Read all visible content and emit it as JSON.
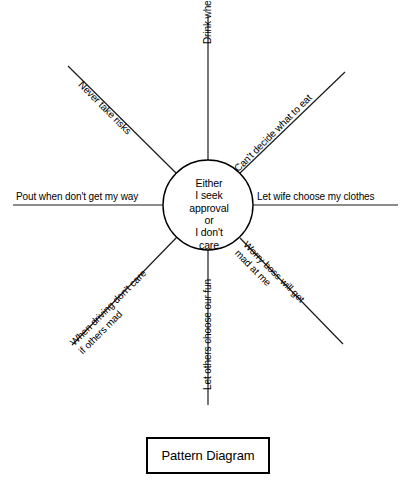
{
  "diagram": {
    "type": "radial-spoke",
    "hub": {
      "name": "center-circle",
      "lines": [
        "Either",
        "I seek",
        "approval",
        "or",
        "I don't",
        "care"
      ],
      "cx": 208,
      "cy": 205,
      "r": 45,
      "stroke": "#000000",
      "fill": "#ffffff"
    },
    "spokes": [
      {
        "id": "left",
        "direction": "west",
        "label": "Pout when don't get my way",
        "lines": [
          "Pout when don't get my way"
        ],
        "angle_deg": 180,
        "x1": 13,
        "y1": 205,
        "x2": 163,
        "y2": 205
      },
      {
        "id": "right",
        "direction": "east",
        "label": "Let wife choose my clothes",
        "lines": [
          "Let wife choose my clothes"
        ],
        "angle_deg": 0,
        "x1": 253,
        "y1": 205,
        "x2": 398,
        "y2": 205
      },
      {
        "id": "top",
        "direction": "north",
        "label": "Drink when feel criticized",
        "lines": [
          "Drink when feel criticized"
        ],
        "angle_deg": -90,
        "x1": 208,
        "y1": 16,
        "x2": 208,
        "y2": 160
      },
      {
        "id": "bottom",
        "direction": "south",
        "label": "Let others choose our fun",
        "lines": [
          "Let others choose our fun"
        ],
        "angle_deg": -90,
        "x1": 208,
        "y1": 250,
        "x2": 208,
        "y2": 405
      },
      {
        "id": "upper-left",
        "direction": "northwest",
        "label": "Never take risks",
        "lines": [
          "Never take risks"
        ],
        "angle_deg": 45,
        "x1": 68,
        "y1": 66,
        "x2": 176,
        "y2": 173
      },
      {
        "id": "upper-right",
        "direction": "northeast",
        "label": "Can't decide what to eat",
        "lines": [
          "Can't decide what to eat"
        ],
        "angle_deg": -45,
        "x1": 240,
        "y1": 173,
        "x2": 345,
        "y2": 72
      },
      {
        "id": "lower-left",
        "direction": "southwest",
        "label": "When driving don't care if others mad",
        "lines": [
          "When driving don't care",
          "if others mad"
        ],
        "angle_deg": -45,
        "x1": 72,
        "y1": 345,
        "x2": 176,
        "y2": 238
      },
      {
        "id": "lower-right",
        "direction": "southeast",
        "label": "Worry boss will get mad at me",
        "lines": [
          "Worry boss will get",
          "mad at me"
        ],
        "angle_deg": 45,
        "x1": 240,
        "y1": 238,
        "x2": 343,
        "y2": 344
      }
    ]
  },
  "caption": {
    "text": "Pattern Diagram"
  },
  "colors": {
    "ink": "#000000",
    "paper": "#ffffff"
  }
}
